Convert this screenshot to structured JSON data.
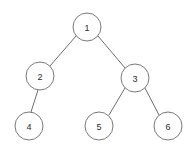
{
  "diagram": {
    "type": "node-link-tree",
    "background_color": "#ffffff",
    "node_fill_color": "#ffffff",
    "node_stroke_color": "#7a7a7a",
    "edge_color": "#6e6e6e",
    "label_color": "#2b2b2b",
    "node_radius": 14,
    "nodes": [
      {
        "id": "n1",
        "label": "1",
        "cx": 87,
        "cy": 27,
        "r": 14
      },
      {
        "id": "n2",
        "label": "2",
        "cx": 40,
        "cy": 76,
        "r": 14
      },
      {
        "id": "n3",
        "label": "3",
        "cx": 135,
        "cy": 78,
        "r": 14
      },
      {
        "id": "n4",
        "label": "4",
        "cx": 29,
        "cy": 126,
        "r": 14
      },
      {
        "id": "n5",
        "label": "5",
        "cx": 99,
        "cy": 126,
        "r": 14
      },
      {
        "id": "n6",
        "label": "6",
        "cx": 168,
        "cy": 126,
        "r": 14
      }
    ],
    "edges": [
      {
        "id": "e1",
        "from": "n1",
        "to": "n2",
        "x1": 76,
        "y1": 36,
        "x2": 50,
        "y2": 66
      },
      {
        "id": "e2",
        "from": "n1",
        "to": "n3",
        "x1": 98,
        "y1": 36,
        "x2": 125,
        "y2": 68
      },
      {
        "id": "e3",
        "from": "n2",
        "to": "n4",
        "x1": 38,
        "y1": 90,
        "x2": 31,
        "y2": 112
      },
      {
        "id": "e4",
        "from": "n3",
        "to": "n5",
        "x1": 125,
        "y1": 88,
        "x2": 109,
        "y2": 115
      },
      {
        "id": "e5",
        "from": "n3",
        "to": "n6",
        "x1": 145,
        "y1": 88,
        "x2": 159,
        "y2": 115
      }
    ]
  }
}
